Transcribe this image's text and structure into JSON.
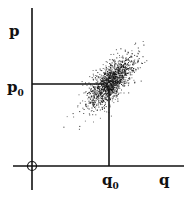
{
  "diagram": {
    "type": "scatter-phase-plane",
    "axes": {
      "x_label": "q",
      "y_label": "p",
      "origin_marker": "circle"
    },
    "reference_point": {
      "x_label": "q",
      "x_sub": "0",
      "y_label": "p",
      "y_sub": "0"
    },
    "cloud": {
      "description": "elliptical scatter of points centered at (q0, p0), elongated along positive diagonal",
      "color": "#111111"
    }
  }
}
